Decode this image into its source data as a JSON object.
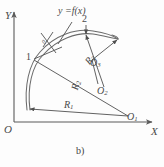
{
  "figure": {
    "caption": "b)",
    "axes": {
      "x_label": "X",
      "y_label": "Y",
      "origin_label": "O"
    },
    "curve_label": "y =f(x)",
    "points": [
      {
        "name": "point-1",
        "label": "1"
      },
      {
        "name": "point-2",
        "label": "2"
      }
    ],
    "centers": [
      {
        "name": "center-o1",
        "letter": "O",
        "index": "1"
      },
      {
        "name": "center-o2",
        "letter": "O",
        "index": "2"
      },
      {
        "name": "center-o3",
        "letter": "O",
        "index": "3"
      }
    ],
    "radii": [
      {
        "name": "radius-r1",
        "letter": "R",
        "index": "1"
      },
      {
        "name": "radius-r2",
        "letter": "R",
        "index": "2"
      },
      {
        "name": "radius-r3",
        "letter": "R",
        "index": "3"
      }
    ],
    "tick_note": "0",
    "colors": {
      "line": "#5a5a5a",
      "curve": "#6b6b6b",
      "text": "#4a4a4a",
      "background": "#fdfdfd"
    }
  }
}
